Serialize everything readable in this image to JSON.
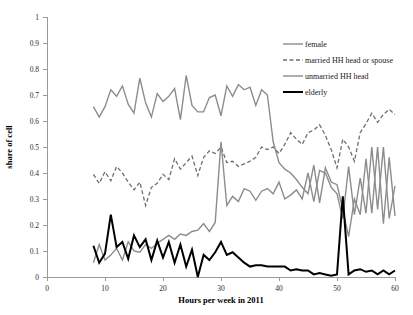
{
  "chart_data": {
    "type": "line",
    "title": "",
    "xlabel": "Hours per week in 2011",
    "ylabel": "share of cell",
    "xlim": [
      0,
      60
    ],
    "ylim": [
      0,
      1
    ],
    "grid": false,
    "legend_position": "top-right",
    "x_ticks": [
      "0",
      "10",
      "20",
      "30",
      "40",
      "50",
      "60"
    ],
    "x_tick_values": [
      0,
      10,
      20,
      30,
      40,
      50,
      60
    ],
    "y_ticks": [
      "0",
      "0.1",
      "0.2",
      "0.3",
      "0.4",
      "0.5",
      "0.6",
      "0.7",
      "0.8",
      "0.9",
      "1"
    ],
    "y_tick_values": [
      0,
      0.1,
      0.2,
      0.3,
      0.4,
      0.5,
      0.6,
      0.7,
      0.8,
      0.9,
      1
    ],
    "x": [
      8,
      9,
      10,
      11,
      12,
      13,
      14,
      15,
      16,
      17,
      18,
      19,
      20,
      21,
      22,
      23,
      24,
      25,
      26,
      27,
      28,
      29,
      30,
      31,
      32,
      33,
      34,
      35,
      36,
      37,
      38,
      39,
      40,
      41,
      42,
      43,
      44,
      45,
      46,
      47,
      48,
      49,
      50,
      51,
      52,
      53,
      54,
      55,
      56,
      57,
      58,
      59,
      60
    ],
    "series": [
      {
        "name": "female",
        "color": "#8c8c8c",
        "style": "solid",
        "width": 1.4,
        "values": [
          0.655,
          0.615,
          0.655,
          0.72,
          0.695,
          0.735,
          0.665,
          0.63,
          0.765,
          0.67,
          0.615,
          0.705,
          0.675,
          0.695,
          0.725,
          0.605,
          0.775,
          0.66,
          0.635,
          0.635,
          0.69,
          0.7,
          0.62,
          0.735,
          0.695,
          0.74,
          0.72,
          0.73,
          0.66,
          0.72,
          0.7,
          0.52,
          0.44,
          0.415,
          0.4,
          0.375,
          0.345,
          0.32,
          0.43,
          0.285,
          0.42,
          0.365,
          0.355,
          0.26,
          0.155,
          0.3,
          0.24,
          0.455,
          0.245,
          0.5,
          0.205,
          0.46,
          0.235
        ]
      },
      {
        "name": "married HH head or spouse",
        "color": "#6e6e6e",
        "style": "dashed",
        "width": 1.3,
        "values": [
          0.395,
          0.36,
          0.405,
          0.37,
          0.425,
          0.4,
          0.365,
          0.335,
          0.365,
          0.275,
          0.345,
          0.36,
          0.395,
          0.375,
          0.455,
          0.415,
          0.44,
          0.465,
          0.39,
          0.46,
          0.485,
          0.475,
          0.5,
          0.44,
          0.445,
          0.425,
          0.435,
          0.445,
          0.46,
          0.5,
          0.49,
          0.5,
          0.475,
          0.51,
          0.555,
          0.53,
          0.51,
          0.555,
          0.565,
          0.585,
          0.545,
          0.49,
          0.42,
          0.53,
          0.5,
          0.445,
          0.555,
          0.59,
          0.63,
          0.595,
          0.625,
          0.645,
          0.625
        ]
      },
      {
        "name": "unmarried HH head",
        "color": "#8c8c8c",
        "style": "solid",
        "width": 1.4,
        "values": [
          0.055,
          0.125,
          0.065,
          0.085,
          0.11,
          0.065,
          0.135,
          0.1,
          0.095,
          0.125,
          0.11,
          0.13,
          0.145,
          0.16,
          0.145,
          0.165,
          0.16,
          0.175,
          0.18,
          0.205,
          0.175,
          0.21,
          0.52,
          0.275,
          0.31,
          0.29,
          0.34,
          0.33,
          0.295,
          0.33,
          0.34,
          0.32,
          0.365,
          0.3,
          0.315,
          0.335,
          0.3,
          0.4,
          0.29,
          0.41,
          0.4,
          0.345,
          0.32,
          0.225,
          0.425,
          0.24,
          0.38,
          0.245,
          0.5,
          0.26,
          0.5,
          0.225,
          0.35
        ]
      },
      {
        "name": "elderly",
        "color": "#000000",
        "style": "solid",
        "width": 2.0,
        "values": [
          0.12,
          0.055,
          0.09,
          0.24,
          0.115,
          0.135,
          0.07,
          0.16,
          0.115,
          0.145,
          0.065,
          0.14,
          0.075,
          0.135,
          0.055,
          0.125,
          0.04,
          0.105,
          0.0,
          0.085,
          0.065,
          0.095,
          0.135,
          0.085,
          0.095,
          0.075,
          0.055,
          0.04,
          0.045,
          0.045,
          0.04,
          0.04,
          0.04,
          0.04,
          0.025,
          0.03,
          0.025,
          0.025,
          0.01,
          0.015,
          0.01,
          0.005,
          0.01,
          0.31,
          0.01,
          0.025,
          0.03,
          0.02,
          0.025,
          0.01,
          0.025,
          0.01,
          0.025
        ]
      }
    ]
  },
  "legend": {
    "items": [
      {
        "label": "female",
        "style": "solid-gray"
      },
      {
        "label": "married HH head or spouse",
        "style": "dashed-gray"
      },
      {
        "label": "unmarried HH head",
        "style": "solid-gray"
      },
      {
        "label": "elderly",
        "style": "solid-black-bold"
      }
    ]
  },
  "colors": {
    "female": "#8c8c8c",
    "married": "#6e6e6e",
    "unmarried": "#8c8c8c",
    "elderly": "#000000",
    "axis": "#9a9a9a",
    "text": "#1a1a1a",
    "background": "#ffffff"
  }
}
